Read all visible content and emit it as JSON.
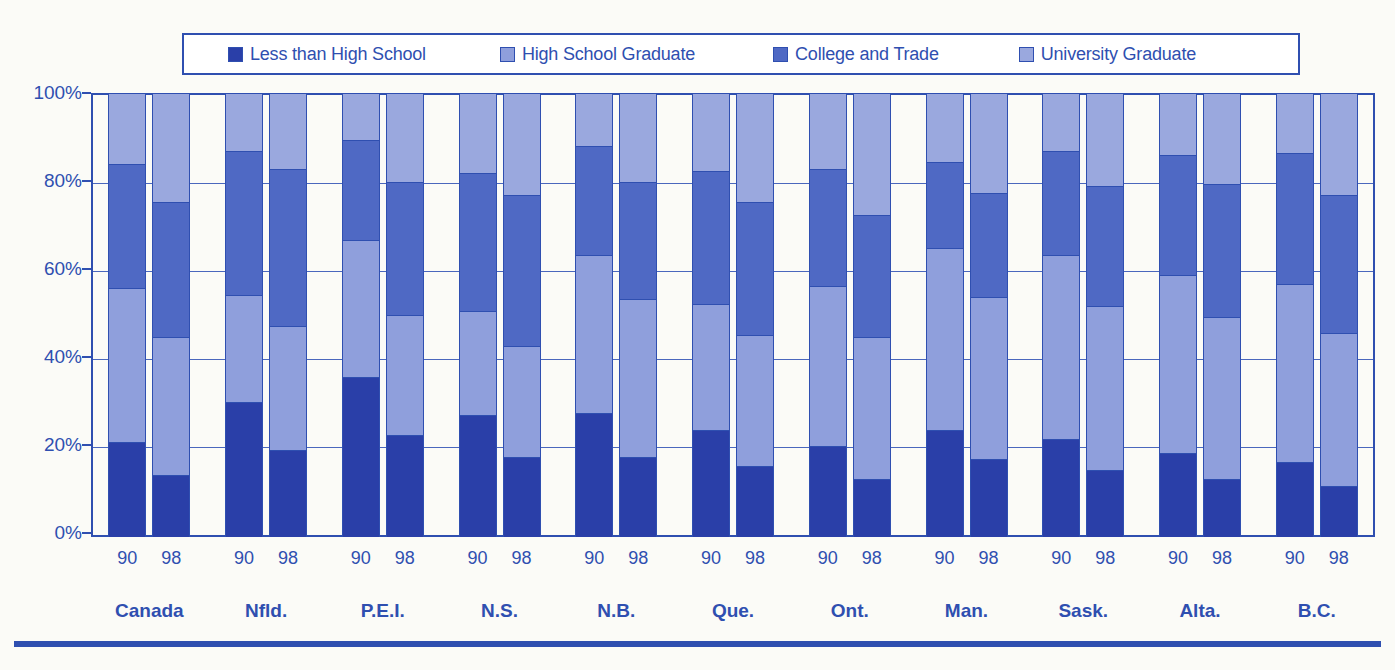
{
  "legend": {
    "position": "top",
    "items": [
      {
        "label": "Less than High School",
        "color": "#2a3fa8",
        "icon": "square-swatch-icon"
      },
      {
        "label": "High School Graduate",
        "color": "#8f9fdc",
        "icon": "square-swatch-icon"
      },
      {
        "label": "College and Trade",
        "color": "#4f69c4",
        "icon": "square-swatch-icon"
      },
      {
        "label": "University Graduate",
        "color": "#9aa8de",
        "icon": "square-swatch-icon"
      }
    ]
  },
  "axis": {
    "y_ticks": [
      "0%",
      "20%",
      "40%",
      "60%",
      "80%",
      "100%"
    ],
    "y_values": [
      0,
      20,
      40,
      60,
      80,
      100
    ]
  },
  "caption": "",
  "chart_data": {
    "type": "bar",
    "stacked": true,
    "stack_total": 100,
    "title": "",
    "subtitle": "",
    "xlabel": "",
    "ylabel": "",
    "ylim": [
      0,
      100
    ],
    "grid": true,
    "legend_position": "top",
    "series": [
      {
        "name": "Less than High School",
        "color": "#2a3fa8"
      },
      {
        "name": "High School Graduate",
        "color": "#8f9fdc"
      },
      {
        "name": "College and Trade",
        "color": "#4f69c4"
      },
      {
        "name": "University Graduate",
        "color": "#9aa8de"
      }
    ],
    "categories": [
      "Canada",
      "Nfld.",
      "P.E.I.",
      "N.S.",
      "N.B.",
      "Que.",
      "Ont.",
      "Man.",
      "Sask.",
      "Alta.",
      "B.C."
    ],
    "subcategories": [
      "90",
      "98"
    ],
    "groups": [
      {
        "region": "Canada",
        "bars": [
          {
            "year": "90",
            "values": [
              21.5,
              34.5,
              28.0,
              16.0
            ],
            "cumulative": [
              21.5,
              56.0,
              84.0,
              100
            ]
          },
          {
            "year": "98",
            "values": [
              14.0,
              31.0,
              30.5,
              24.5
            ],
            "cumulative": [
              14.0,
              45.0,
              75.5,
              100
            ]
          }
        ]
      },
      {
        "region": "Nfld.",
        "bars": [
          {
            "year": "90",
            "values": [
              30.5,
              24.0,
              32.5,
              13.0
            ],
            "cumulative": [
              30.5,
              54.5,
              87.0,
              100
            ]
          },
          {
            "year": "98",
            "values": [
              19.5,
              28.0,
              35.5,
              17.0
            ],
            "cumulative": [
              19.5,
              47.5,
              83.0,
              100
            ]
          }
        ]
      },
      {
        "region": "P.E.I.",
        "bars": [
          {
            "year": "90",
            "values": [
              36.0,
              31.0,
              22.5,
              10.5
            ],
            "cumulative": [
              36.0,
              67.0,
              89.5,
              100
            ]
          },
          {
            "year": "98",
            "values": [
              23.0,
              27.0,
              30.0,
              20.0
            ],
            "cumulative": [
              23.0,
              50.0,
              80.0,
              100
            ]
          }
        ]
      },
      {
        "region": "N.S.",
        "bars": [
          {
            "year": "90",
            "values": [
              27.5,
              23.5,
              31.0,
              18.0
            ],
            "cumulative": [
              27.5,
              51.0,
              82.0,
              100
            ]
          },
          {
            "year": "98",
            "values": [
              18.0,
              25.0,
              34.0,
              23.0
            ],
            "cumulative": [
              18.0,
              43.0,
              77.0,
              100
            ]
          }
        ]
      },
      {
        "region": "N.B.",
        "bars": [
          {
            "year": "90",
            "values": [
              28.0,
              35.5,
              24.5,
              12.0
            ],
            "cumulative": [
              28.0,
              63.5,
              88.0,
              100
            ]
          },
          {
            "year": "98",
            "values": [
              18.0,
              35.5,
              26.5,
              20.0
            ],
            "cumulative": [
              18.0,
              53.5,
              80.0,
              100
            ]
          }
        ]
      },
      {
        "region": "Que.",
        "bars": [
          {
            "year": "90",
            "values": [
              24.0,
              28.5,
              30.0,
              17.5
            ],
            "cumulative": [
              24.0,
              52.5,
              82.5,
              100
            ]
          },
          {
            "year": "98",
            "values": [
              16.0,
              29.5,
              30.0,
              24.5
            ],
            "cumulative": [
              16.0,
              45.5,
              75.5,
              100
            ]
          }
        ]
      },
      {
        "region": "Ont.",
        "bars": [
          {
            "year": "90",
            "values": [
              20.5,
              36.0,
              26.5,
              17.0
            ],
            "cumulative": [
              20.5,
              56.5,
              83.0,
              100
            ]
          },
          {
            "year": "98",
            "values": [
              13.0,
              32.0,
              27.5,
              27.5
            ],
            "cumulative": [
              13.0,
              45.0,
              72.5,
              100
            ]
          }
        ]
      },
      {
        "region": "Man.",
        "bars": [
          {
            "year": "90",
            "values": [
              24.0,
              41.0,
              19.5,
              15.5
            ],
            "cumulative": [
              24.0,
              65.0,
              84.5,
              100
            ]
          },
          {
            "year": "98",
            "values": [
              17.5,
              36.5,
              23.5,
              22.5
            ],
            "cumulative": [
              17.5,
              54.0,
              77.5,
              100
            ]
          }
        ]
      },
      {
        "region": "Sask.",
        "bars": [
          {
            "year": "90",
            "values": [
              22.0,
              41.5,
              23.5,
              13.0
            ],
            "cumulative": [
              22.0,
              63.5,
              87.0,
              100
            ]
          },
          {
            "year": "98",
            "values": [
              15.0,
              37.0,
              27.0,
              21.0
            ],
            "cumulative": [
              15.0,
              52.0,
              79.0,
              100
            ]
          }
        ]
      },
      {
        "region": "Alta.",
        "bars": [
          {
            "year": "90",
            "values": [
              19.0,
              40.0,
              27.0,
              14.0
            ],
            "cumulative": [
              19.0,
              59.0,
              86.0,
              100
            ]
          },
          {
            "year": "98",
            "values": [
              13.0,
              36.5,
              30.0,
              20.5
            ],
            "cumulative": [
              13.0,
              49.5,
              79.5,
              100
            ]
          }
        ]
      },
      {
        "region": "B.C.",
        "bars": [
          {
            "year": "90",
            "values": [
              17.0,
              40.0,
              29.5,
              13.5
            ],
            "cumulative": [
              17.0,
              57.0,
              86.5,
              100
            ]
          },
          {
            "year": "98",
            "values": [
              11.5,
              34.5,
              31.0,
              23.0
            ],
            "cumulative": [
              11.5,
              46.0,
              77.0,
              100
            ]
          }
        ]
      }
    ]
  }
}
